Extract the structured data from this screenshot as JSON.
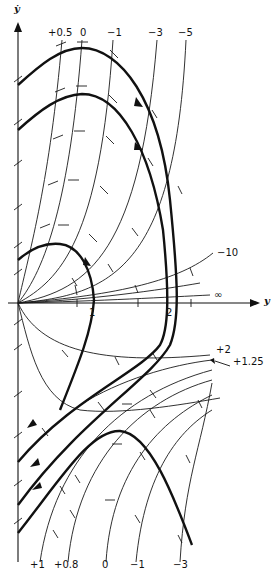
{
  "diagram": {
    "type": "phase-plane isocline diagram",
    "axes": {
      "x_label": "y",
      "y_label": "ẏ",
      "x_ticks": [
        "1",
        "2"
      ],
      "infinity_label": "∞"
    },
    "isocline_labels_top": [
      "+0.5",
      "0",
      "−1",
      "−3",
      "−5"
    ],
    "isocline_labels_right": [
      "−10",
      "+2",
      "+1.25"
    ],
    "isocline_labels_bottom": [
      "+1",
      "+0.8",
      "0",
      "−1",
      "−3"
    ],
    "colors": {
      "ink": "#111111",
      "background": "#ffffff"
    }
  }
}
